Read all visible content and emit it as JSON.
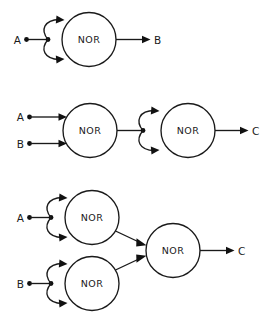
{
  "figure": {
    "background_color": "#ffffff",
    "line_color": "#1a1a1a",
    "gate_label": "NOR"
  },
  "diagrams": [
    {
      "name": "nor-as-inverter",
      "gate_labels": [
        "NOR"
      ],
      "inputs": [
        "A"
      ],
      "outputs": [
        "B"
      ],
      "description": "Single NOR gate with input A tied to both of its inputs, output B"
    },
    {
      "name": "nor-as-or",
      "gate_labels": [
        "NOR",
        "NOR"
      ],
      "inputs": [
        "A",
        "B"
      ],
      "outputs": [
        "C"
      ],
      "description": "Two-input NOR gate followed by a NOR wired as an inverter, output C"
    },
    {
      "name": "nor-as-and",
      "gate_labels": [
        "NOR",
        "NOR",
        "NOR"
      ],
      "inputs": [
        "A",
        "B"
      ],
      "outputs": [
        "C"
      ],
      "description": "Two NOR inverters feeding a two-input NOR gate, output C"
    }
  ],
  "labels": {
    "d1_gate1": "NOR",
    "d1_in_a": "A",
    "d1_out_b": "B",
    "d2_gate1": "NOR",
    "d2_gate2": "NOR",
    "d2_in_a": "A",
    "d2_in_b": "B",
    "d2_out_c": "C",
    "d3_gate1": "NOR",
    "d3_gate2": "NOR",
    "d3_gate3": "NOR",
    "d3_in_a": "A",
    "d3_in_b": "B",
    "d3_out_c": "C"
  }
}
